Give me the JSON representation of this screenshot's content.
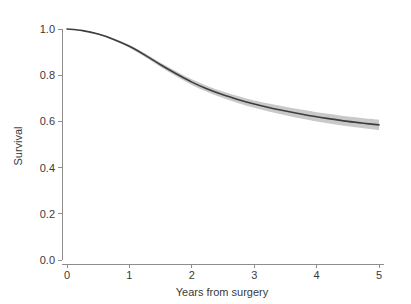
{
  "chart_data": {
    "type": "line",
    "title": "",
    "xlabel": "Years from surgery",
    "ylabel": "Survival",
    "xlim": [
      0,
      5
    ],
    "ylim": [
      0,
      1.0
    ],
    "grid": false,
    "legend": "none",
    "x_ticks": [
      "0",
      "1",
      "2",
      "3",
      "4",
      "5"
    ],
    "x_tick_values": [
      0,
      1,
      2,
      3,
      4,
      5
    ],
    "y_ticks": [
      "0.0",
      "0.2",
      "0.4",
      "0.6",
      "0.8",
      "1.0"
    ],
    "y_tick_values": [
      0.0,
      0.2,
      0.4,
      0.6,
      0.8,
      1.0
    ],
    "x": [
      0,
      0.25,
      0.5,
      0.75,
      1.0,
      1.25,
      1.5,
      1.75,
      2.0,
      2.25,
      2.5,
      2.75,
      3.0,
      3.25,
      3.5,
      3.75,
      4.0,
      4.25,
      4.5,
      4.75,
      5.0
    ],
    "series": [
      {
        "name": "Survival",
        "color": "#3d3d3d",
        "values": [
          1.0,
          0.993,
          0.978,
          0.955,
          0.925,
          0.887,
          0.845,
          0.806,
          0.77,
          0.74,
          0.715,
          0.694,
          0.675,
          0.659,
          0.645,
          0.632,
          0.62,
          0.61,
          0.6,
          0.592,
          0.585
        ]
      }
    ],
    "confidence_band": {
      "name": "95% confidence interval",
      "color": "#c9c9c9",
      "lower": [
        1.0,
        0.992,
        0.975,
        0.951,
        0.919,
        0.879,
        0.836,
        0.795,
        0.758,
        0.727,
        0.701,
        0.679,
        0.659,
        0.642,
        0.627,
        0.613,
        0.6,
        0.589,
        0.579,
        0.57,
        0.562
      ],
      "upper": [
        1.0,
        0.994,
        0.981,
        0.959,
        0.931,
        0.895,
        0.854,
        0.817,
        0.782,
        0.753,
        0.729,
        0.709,
        0.691,
        0.676,
        0.663,
        0.651,
        0.64,
        0.631,
        0.621,
        0.614,
        0.608
      ]
    }
  },
  "axes": {
    "y_title": "Survival",
    "x_title": "Years from surgery"
  }
}
